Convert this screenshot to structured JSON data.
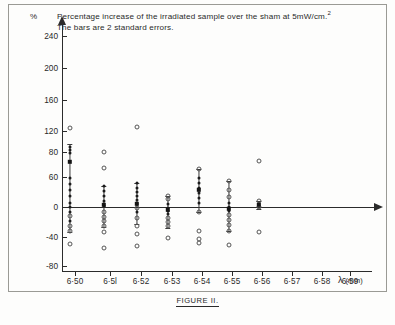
{
  "chart_data": {
    "type": "scatter",
    "title": "Percentage increase of the irradiated sample over the sham at 5mW/cm.",
    "title_sup": "2",
    "subtitle": "The bars are 2 standard errors.",
    "ylabel": "%",
    "xlabel": "λ",
    "xlabel_unit": "(mm)",
    "caption": "FIGURE II.",
    "grid": false,
    "legend": "none",
    "ylim": [
      -95,
      255
    ],
    "yticks": [
      {
        "value": 240,
        "label": "240",
        "y": 36
      },
      {
        "value": 200,
        "label": "200",
        "y": 68
      },
      {
        "value": 160,
        "label": "160",
        "y": 100
      },
      {
        "value": 120,
        "label": "120",
        "y": 131
      },
      {
        "value": 80,
        "label": "80",
        "y": 152
      },
      {
        "value": 60,
        "label": "60",
        "y": 177
      },
      {
        "value": 0,
        "label": "0",
        "y": 207
      },
      {
        "value": -40,
        "label": "-40",
        "y": 237
      },
      {
        "value": -80,
        "label": "-80",
        "y": 266
      }
    ],
    "xticks": [
      {
        "label": "6·50",
        "x": 75
      },
      {
        "label": "6·5l",
        "x": 110
      },
      {
        "label": "6·52",
        "x": 141
      },
      {
        "label": "6·53",
        "x": 172
      },
      {
        "label": "6·54",
        "x": 202
      },
      {
        "label": "6·55",
        "x": 232
      },
      {
        "label": "6·56",
        "x": 262
      },
      {
        "label": "6·57",
        "x": 292
      },
      {
        "label": "6·58",
        "x": 322
      },
      {
        "label": "6·59",
        "x": 350
      }
    ],
    "series": [
      {
        "name": "6·50",
        "x": 70,
        "mean_y": 162,
        "error_top": 144,
        "error_bottom": 232,
        "points": [
          {
            "y": 128,
            "style": "open"
          },
          {
            "y": 147,
            "style": "filled"
          },
          {
            "y": 150,
            "style": "filled"
          },
          {
            "y": 153,
            "style": "filled"
          },
          {
            "y": 178,
            "style": "filled"
          },
          {
            "y": 184,
            "style": "filled"
          },
          {
            "y": 190,
            "style": "filled"
          },
          {
            "y": 196,
            "style": "filled"
          },
          {
            "y": 203,
            "style": "filled"
          },
          {
            "y": 207,
            "style": "filled"
          },
          {
            "y": 212,
            "style": "filled"
          },
          {
            "y": 216,
            "style": "open"
          },
          {
            "y": 221,
            "style": "filled"
          },
          {
            "y": 226,
            "style": "open"
          },
          {
            "y": 231,
            "style": "open"
          },
          {
            "y": 244,
            "style": "open"
          }
        ]
      },
      {
        "name": "6·5l",
        "x": 104,
        "mean_y": 205,
        "error_top": 186,
        "error_bottom": 227,
        "points": [
          {
            "y": 152,
            "style": "open"
          },
          {
            "y": 168,
            "style": "open"
          },
          {
            "y": 186,
            "style": "filled"
          },
          {
            "y": 191,
            "style": "filled"
          },
          {
            "y": 196,
            "style": "filled"
          },
          {
            "y": 201,
            "style": "filled"
          },
          {
            "y": 206,
            "style": "filled"
          },
          {
            "y": 212,
            "style": "open"
          },
          {
            "y": 217,
            "style": "open"
          },
          {
            "y": 221,
            "style": "open"
          },
          {
            "y": 226,
            "style": "open"
          },
          {
            "y": 232,
            "style": "open"
          },
          {
            "y": 248,
            "style": "open"
          }
        ]
      },
      {
        "name": "6·52",
        "x": 137,
        "mean_y": 204,
        "error_top": 183,
        "error_bottom": 224,
        "points": [
          {
            "y": 127,
            "style": "open"
          },
          {
            "y": 183,
            "style": "filled"
          },
          {
            "y": 188,
            "style": "filled"
          },
          {
            "y": 192,
            "style": "filled"
          },
          {
            "y": 196,
            "style": "filled"
          },
          {
            "y": 200,
            "style": "filled"
          },
          {
            "y": 204,
            "style": "filled"
          },
          {
            "y": 208,
            "style": "open"
          },
          {
            "y": 212,
            "style": "filled"
          },
          {
            "y": 218,
            "style": "open"
          },
          {
            "y": 226,
            "style": "open"
          },
          {
            "y": 234,
            "style": "open"
          },
          {
            "y": 246,
            "style": "open"
          }
        ]
      },
      {
        "name": "6·53",
        "x": 168,
        "mean_y": 210,
        "error_top": 196,
        "error_bottom": 228,
        "points": [
          {
            "y": 196,
            "style": "open"
          },
          {
            "y": 199,
            "style": "open"
          },
          {
            "y": 204,
            "style": "filled"
          },
          {
            "y": 208,
            "style": "filled"
          },
          {
            "y": 211,
            "style": "filled"
          },
          {
            "y": 214,
            "style": "filled"
          },
          {
            "y": 218,
            "style": "open"
          },
          {
            "y": 222,
            "style": "open"
          },
          {
            "y": 226,
            "style": "open"
          },
          {
            "y": 238,
            "style": "open"
          }
        ]
      },
      {
        "name": "6·54",
        "x": 199,
        "mean_y": 190,
        "error_top": 169,
        "error_bottom": 212,
        "points": [
          {
            "y": 169,
            "style": "open"
          },
          {
            "y": 178,
            "style": "filled"
          },
          {
            "y": 183,
            "style": "filled"
          },
          {
            "y": 188,
            "style": "filled"
          },
          {
            "y": 193,
            "style": "filled"
          },
          {
            "y": 198,
            "style": "filled"
          },
          {
            "y": 203,
            "style": "filled"
          },
          {
            "y": 212,
            "style": "open"
          },
          {
            "y": 231,
            "style": "open"
          },
          {
            "y": 239,
            "style": "open"
          },
          {
            "y": 243,
            "style": "open"
          }
        ]
      },
      {
        "name": "6·55",
        "x": 229,
        "mean_y": 209,
        "error_top": 181,
        "error_bottom": 231,
        "points": [
          {
            "y": 181,
            "style": "open"
          },
          {
            "y": 190,
            "style": "open"
          },
          {
            "y": 197,
            "style": "open"
          },
          {
            "y": 203,
            "style": "filled"
          },
          {
            "y": 207,
            "style": "filled"
          },
          {
            "y": 211,
            "style": "filled"
          },
          {
            "y": 215,
            "style": "open"
          },
          {
            "y": 220,
            "style": "open"
          },
          {
            "y": 225,
            "style": "open"
          },
          {
            "y": 231,
            "style": "open"
          },
          {
            "y": 245,
            "style": "open"
          }
        ]
      },
      {
        "name": "6·56",
        "x": 259,
        "mean_y": 205,
        "error_top": 201,
        "error_bottom": 209,
        "points": [
          {
            "y": 161,
            "style": "open"
          },
          {
            "y": 201,
            "style": "open"
          },
          {
            "y": 204,
            "style": "filled"
          },
          {
            "y": 207,
            "style": "open"
          },
          {
            "y": 232,
            "style": "open"
          }
        ]
      }
    ]
  }
}
